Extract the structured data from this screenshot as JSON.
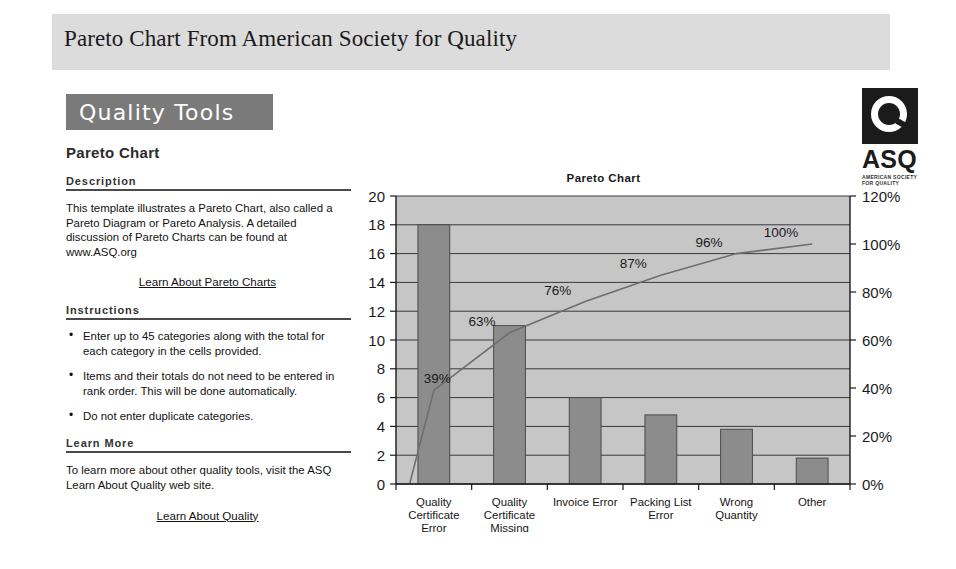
{
  "header": {
    "title": "Pareto Chart From American Society for Quality"
  },
  "panel": {
    "banner_label": "Quality Tools",
    "subtitle": "Pareto Chart",
    "description_heading": "Description",
    "description_text": "This template illustrates a Pareto Chart, also called a Pareto Diagram or Pareto Analysis.  A detailed discussion of Pareto Charts can be found at www.ASQ.org",
    "description_link": "Learn About Pareto Charts",
    "instructions_heading": "Instructions",
    "instructions": [
      "Enter up to 45 categories along with the total for each category in the cells provided.",
      "Items and their totals do not need to be entered in rank order.  This will be done automatically.",
      "Do not enter duplicate categories."
    ],
    "learn_more_heading": "Learn More",
    "learn_more_text": "To learn more about other quality tools, visit the ASQ Learn About Quality web site.",
    "learn_more_link": "Learn About Quality"
  },
  "logo": {
    "mark_name": "asq-q-logo",
    "wordmark": "ASQ",
    "tagline_line1": "AMERICAN SOCIETY",
    "tagline_line2": "FOR QUALITY"
  },
  "chart_data": {
    "type": "bar",
    "title": "Pareto Chart",
    "xlabel": "",
    "ylabel": "",
    "grid": true,
    "legend": "none",
    "categories": [
      "Quality Certificate Error",
      "Quality Certificate Missing",
      "Invoice Error",
      "Packing List Error",
      "Wrong Quantity",
      "Other"
    ],
    "category_lines": [
      [
        "Quality",
        "Certificate",
        "Error"
      ],
      [
        "Quality",
        "Certificate",
        "Missing"
      ],
      [
        "Invoice Error"
      ],
      [
        "Packing List",
        "Error"
      ],
      [
        "Wrong",
        "Quantity"
      ],
      [
        "Other"
      ]
    ],
    "values": [
      18,
      11,
      6,
      4.8,
      3.8,
      1.8
    ],
    "ylim": [
      0,
      20
    ],
    "yticks": [
      0,
      2,
      4,
      6,
      8,
      10,
      12,
      14,
      16,
      18,
      20
    ],
    "ytick_labels": [
      "0",
      "2",
      "4",
      "6",
      "8",
      "10",
      "12",
      "14",
      "16",
      "18",
      "20"
    ],
    "series": [
      {
        "name": "Cumulative %",
        "type": "line",
        "values": [
          39,
          63,
          76,
          87,
          96,
          100
        ],
        "labels": [
          "39%",
          "63%",
          "76%",
          "87%",
          "96%",
          "100%"
        ]
      }
    ],
    "y2lim": [
      0,
      120
    ],
    "y2ticks": [
      0,
      20,
      40,
      60,
      80,
      100,
      120
    ],
    "y2tick_labels": [
      "0%",
      "20%",
      "40%",
      "60%",
      "80%",
      "100%",
      "120%"
    ],
    "colors": {
      "bar_fill": "#8c8c8c",
      "plot_background": "#c6c6c6",
      "line": "#6e6e6e",
      "axis": "#1a1a1a"
    }
  }
}
